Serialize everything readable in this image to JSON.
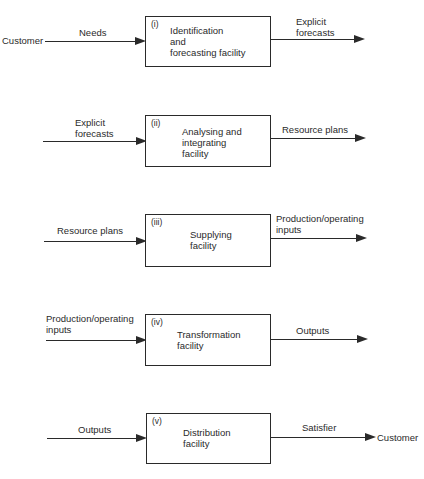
{
  "stages": [
    {
      "number": "(i)",
      "box_text": "Identification\nand\nforecasting facility",
      "input_source": "Customer",
      "input_label": "Needs",
      "output_label": "Explicit\nforecasts"
    },
    {
      "number": "(ii)",
      "box_text": "Analysing and\nintegrating\nfacility",
      "input_label": "Explicit\nforecasts",
      "output_label": "Resource plans"
    },
    {
      "number": "(iii)",
      "box_text": "Supplying\nfacility",
      "input_label": "Resource plans",
      "output_label": "Production/operating\ninputs"
    },
    {
      "number": "(iv)",
      "box_text": "Transformation\nfacility",
      "input_label": "Production/operating\ninputs",
      "output_label": "Outputs"
    },
    {
      "number": "(v)",
      "box_text": "Distribution\nfacility",
      "input_label": "Outputs",
      "output_label": "Satisfier",
      "output_target": "Customer"
    }
  ]
}
